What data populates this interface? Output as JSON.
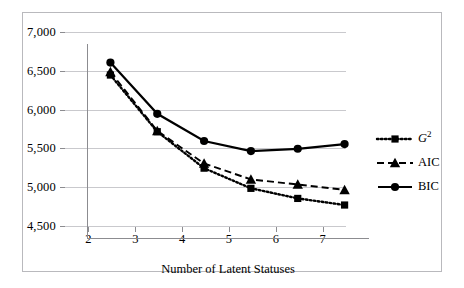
{
  "chart_data": {
    "type": "line",
    "title": "",
    "xlabel": "Number of Latent Statuses",
    "ylabel": "",
    "x": [
      2,
      3,
      4,
      5,
      6,
      7
    ],
    "categories": [
      "2",
      "3",
      "4",
      "5",
      "6",
      "7"
    ],
    "xlim": [
      1.5,
      7.5
    ],
    "ylim": [
      4500,
      7000
    ],
    "ytick_labels": [
      "7,000",
      "6,500",
      "6,000",
      "5,500",
      "5,000",
      "4,500"
    ],
    "ytick_values": [
      7000,
      6500,
      6000,
      5500,
      5000,
      4500
    ],
    "xtick_labels": [
      "2",
      "3",
      "4",
      "5",
      "6",
      "7"
    ],
    "grid": "horizontal",
    "legend_position": "right",
    "series": [
      {
        "name": "G2",
        "label": "G",
        "label_sup": "2",
        "marker": "square",
        "linestyle": "dotted",
        "color": "#000000",
        "values": [
          6600,
          5870,
          5400,
          5140,
          5010,
          4925
        ]
      },
      {
        "name": "AIC",
        "label": "AIC",
        "label_sup": "",
        "marker": "triangle",
        "linestyle": "dashed",
        "color": "#000000",
        "values": [
          6640,
          5880,
          5460,
          5255,
          5190,
          5120
        ]
      },
      {
        "name": "BIC",
        "label": "BIC",
        "label_sup": "",
        "marker": "circle",
        "linestyle": "solid",
        "color": "#000000",
        "values": [
          6760,
          6100,
          5750,
          5620,
          5650,
          5710
        ]
      }
    ]
  },
  "legend": {
    "items": [
      {
        "label": "G",
        "sup": "2",
        "marker": "square-marker-icon",
        "linestyle": "dotted"
      },
      {
        "label": "AIC",
        "sup": "",
        "marker": "triangle-marker-icon",
        "linestyle": "dashed"
      },
      {
        "label": "BIC",
        "sup": "",
        "marker": "circle-marker-icon",
        "linestyle": "solid"
      }
    ]
  },
  "colors": {
    "series": "#000000",
    "gridline": "#c9c9cd",
    "axis": "#8c8c90",
    "frame": "#b9b9bd",
    "background": "#ffffff"
  }
}
